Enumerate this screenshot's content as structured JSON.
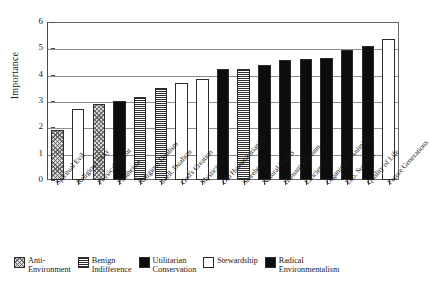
{
  "chart_data": {
    "type": "bar",
    "title": "",
    "xlabel": "",
    "ylabel": "Importance",
    "ylim": [
      0,
      6
    ],
    "yticks": [
      0,
      1,
      2,
      3,
      4,
      5,
      6
    ],
    "grid": true,
    "legend_position": "below",
    "categories": [
      "Spiritual Evil",
      "Religious Duty",
      "Physical Threat",
      "Pantheism",
      "Religious Dualism",
      "Intell. Dualism",
      "God's Creation",
      "Mysticism",
      "Old Humanitarianism",
      "Storehouse",
      "Natural Rights",
      "Humanitarianism",
      "Efficiency",
      "Organicism/Animism",
      "Eco. Survival",
      "Quality of Life",
      "Future Generations"
    ],
    "values": [
      1.9,
      2.7,
      2.9,
      3.0,
      3.15,
      3.5,
      3.7,
      3.85,
      4.2,
      4.2,
      4.35,
      4.55,
      4.6,
      4.65,
      4.95,
      5.1,
      5.35
    ],
    "groups": [
      "anti-environment",
      "stewardship",
      "anti-environment",
      "radical-environmentalism",
      "benign-indifference",
      "benign-indifference",
      "stewardship",
      "stewardship",
      "radical-environmentalism",
      "benign-indifference",
      "radical-environmentalism",
      "radical-environmentalism",
      "utilitarian-conservation",
      "radical-environmentalism",
      "radical-environmentalism",
      "radical-environmentalism",
      "stewardship"
    ],
    "legend": [
      {
        "key": "anti-environment",
        "label_line1": "Anti-",
        "label_line2": "Environment",
        "pattern": "diagonal-hatch",
        "color": "#d9d9d9"
      },
      {
        "key": "benign-indifference",
        "label_line1": "Benign",
        "label_line2": "Indifference",
        "pattern": "horizontal-lines",
        "color": "#ffffff"
      },
      {
        "key": "utilitarian-conservation",
        "label_line1": "Utilitarian",
        "label_line2": "Conservation",
        "pattern": "solid-black",
        "color": "#0d0d0d"
      },
      {
        "key": "stewardship",
        "label_line1": "Stewardship",
        "label_line2": "",
        "pattern": "solid-white",
        "color": "#ffffff"
      },
      {
        "key": "radical-environmentalism",
        "label_line1": "Radical",
        "label_line2": "Environmentalism",
        "pattern": "solid-black",
        "color": "#0d0d0d"
      }
    ]
  }
}
